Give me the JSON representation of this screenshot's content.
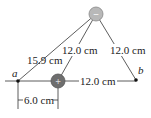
{
  "diagram": {
    "charges": {
      "negative": {
        "sign": "−",
        "color": "#b0b0b0"
      },
      "positive": {
        "sign": "+",
        "color": "#707070"
      }
    },
    "points": {
      "a": "a",
      "b": "b"
    },
    "distances": {
      "a_to_negative": "15.9 cm",
      "positive_to_negative": "12.0 cm",
      "b_to_negative": "12.0 cm",
      "positive_to_b": "12.0 cm",
      "a_to_positive": "6.0 cm"
    }
  }
}
